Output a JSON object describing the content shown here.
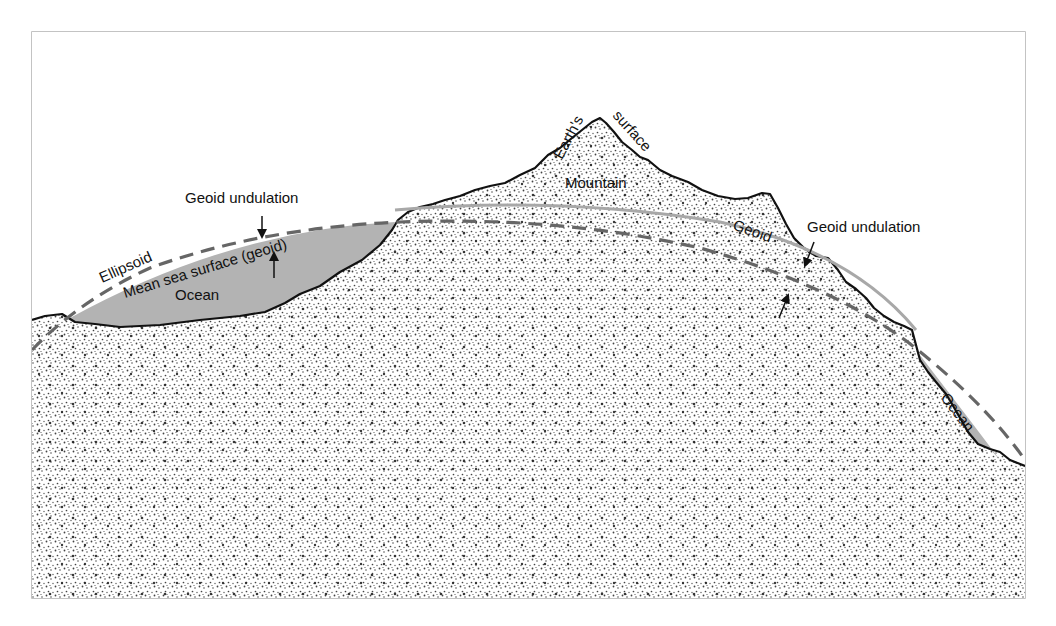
{
  "diagram": {
    "type": "geodesy-cross-section",
    "labels": {
      "earths_surface_part1": "Earth's",
      "earths_surface_part2": "surface",
      "mountain": "Mountain",
      "geoid_undulation_left": "Geoid undulation",
      "geoid_undulation_right": "Geoid undulation",
      "ellipsoid": "Ellipsoid",
      "mean_sea_surface": "Mean sea surface (geoid)",
      "ocean_left": "Ocean",
      "ocean_right": "Ocean",
      "geoid": "Geoid"
    },
    "colors": {
      "frame": "#b0b0b0",
      "terrain_outline": "#111111",
      "ocean_fill": "#b3b3b3",
      "ellipsoid_dash": "#666666",
      "geoid_line": "#a8a8a8",
      "stipple": "#333333"
    }
  }
}
